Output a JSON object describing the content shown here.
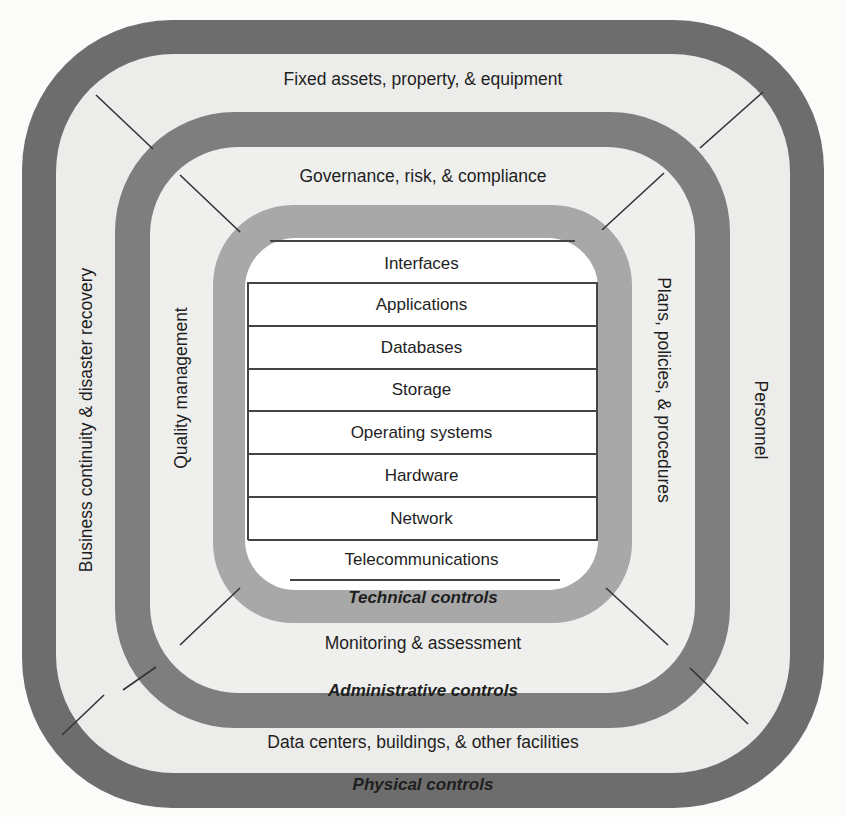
{
  "diagram": {
    "type": "nested-rings",
    "colors": {
      "outer_ring": "#6d6d6d",
      "middle_ring": "#7e7e7e",
      "inner_ring": "#a8a8a8",
      "band_fill": "#ececea",
      "core_fill": "#ffffff",
      "text": "#1e1e1e"
    },
    "physical": {
      "title": "Physical controls",
      "top": "Fixed assets, property, & equipment",
      "left": "Business continuity & disaster recovery",
      "right": "Personnel",
      "bottom": "Data centers, buildings, & other facilities"
    },
    "administrative": {
      "title": "Administrative controls",
      "top": "Governance, risk, & compliance",
      "left": "Quality management",
      "right": "Plans, policies, & procedures",
      "bottom": "Monitoring & assessment"
    },
    "technical": {
      "title": "Technical controls",
      "layers": [
        "Interfaces",
        "Applications",
        "Databases",
        "Storage",
        "Operating systems",
        "Hardware",
        "Network",
        "Telecommunications"
      ]
    }
  }
}
